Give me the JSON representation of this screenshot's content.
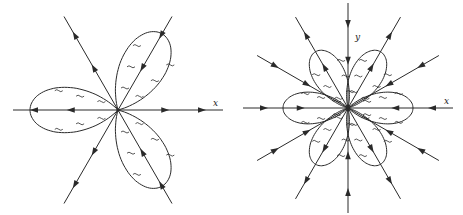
{
  "figure": {
    "left": {
      "title": "Three-petal phase portrait",
      "center": [
        118,
        110
      ],
      "x_label": "x",
      "x_label_pos": [
        213,
        106
      ],
      "petals": 3,
      "petal_angles_deg": [
        180,
        60,
        -60
      ],
      "petal_length": 88,
      "petal_width": 58,
      "rays_deg": [
        0,
        60,
        120,
        180,
        240,
        300
      ],
      "ray_length": 105,
      "ray_direction": "out-right / in-left on petal axes"
    },
    "right": {
      "title": "Six-petal phase portrait",
      "center": [
        348,
        108
      ],
      "x_label": "x",
      "x_label_pos": [
        444,
        104
      ],
      "y_label": "y",
      "y_label_pos": [
        355,
        40
      ],
      "petals": 6,
      "petal_angles_deg": [
        0,
        60,
        120,
        180,
        240,
        300
      ],
      "petal_length": 65,
      "petal_width": 40,
      "rays_deg": [
        0,
        30,
        60,
        90,
        120,
        150,
        180,
        210,
        240,
        270,
        300,
        330
      ],
      "ray_length": 105
    },
    "stroke_color": "#2a2a2a",
    "background": "#ffffff"
  }
}
